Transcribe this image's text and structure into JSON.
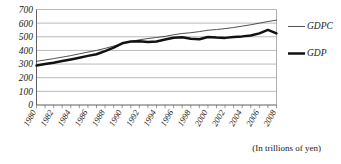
{
  "caption": "(In trillions of yen)",
  "legend": {
    "position": "right",
    "items": [
      {
        "label": "GDPC",
        "style": "thin-line",
        "color": "#3c3c3c"
      },
      {
        "label": "GDP",
        "style": "thick-line",
        "color": "#111111"
      }
    ]
  },
  "axes": {
    "y_ticks": [
      "700",
      "600",
      "500",
      "400",
      "300",
      "200",
      "100",
      "0"
    ],
    "x_ticks_shown": [
      "1980",
      "1982",
      "1984",
      "1986",
      "1988",
      "1990",
      "1992",
      "1994",
      "1996",
      "1998",
      "2000",
      "2002",
      "2004",
      "2006",
      "2008"
    ]
  },
  "chart_data": {
    "type": "line",
    "title": "",
    "subtitle": "",
    "xlabel": "",
    "ylabel": "",
    "annotations": [
      "(In trillions of yen)"
    ],
    "grid": true,
    "legend_position": "right",
    "ylim": [
      0,
      700
    ],
    "yticks": [
      0,
      100,
      200,
      300,
      400,
      500,
      600,
      700
    ],
    "xlim": [
      1980,
      2008
    ],
    "xticks": [
      1980,
      1982,
      1984,
      1986,
      1988,
      1990,
      1992,
      1994,
      1996,
      1998,
      2000,
      2002,
      2004,
      2006,
      2008
    ],
    "x": [
      1980,
      1981,
      1982,
      1983,
      1984,
      1985,
      1986,
      1987,
      1988,
      1989,
      1990,
      1991,
      1992,
      1993,
      1994,
      1995,
      1996,
      1997,
      1998,
      1999,
      2000,
      2001,
      2002,
      2003,
      2004,
      2005,
      2006,
      2007,
      2008
    ],
    "series": [
      {
        "name": "GDPC",
        "color": "#3c3c3c",
        "linewidth": "thin",
        "values": [
          320,
          330,
          340,
          351,
          362,
          375,
          388,
          400,
          415,
          432,
          450,
          465,
          478,
          487,
          495,
          503,
          515,
          524,
          530,
          538,
          548,
          553,
          560,
          568,
          578,
          588,
          600,
          612,
          622
        ]
      },
      {
        "name": "GDP",
        "color": "#111111",
        "linewidth": "thick",
        "values": [
          290,
          300,
          310,
          322,
          334,
          347,
          360,
          372,
          395,
          420,
          452,
          465,
          468,
          462,
          466,
          480,
          493,
          496,
          485,
          482,
          498,
          494,
          492,
          498,
          503,
          510,
          525,
          550,
          525
        ]
      }
    ]
  }
}
